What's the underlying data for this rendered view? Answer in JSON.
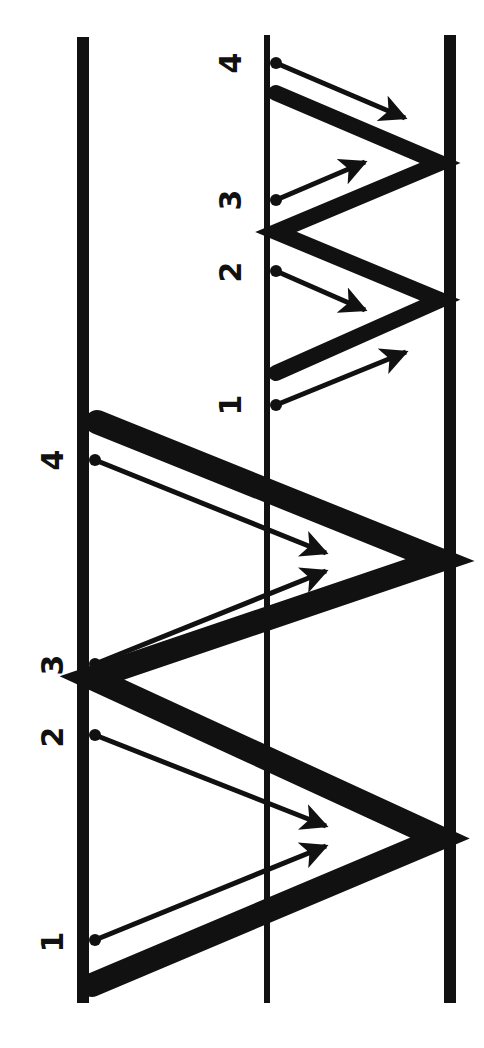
{
  "diagram": {
    "colors": {
      "ink": "#111111",
      "background": "#ffffff"
    },
    "boundaries": [
      {
        "name": "left-boundary",
        "x": 83,
        "y1": 37,
        "y2": 1003,
        "width": 12
      },
      {
        "name": "middle-boundary",
        "x": 267,
        "y1": 35,
        "y2": 1003,
        "width": 6
      },
      {
        "name": "right-boundary",
        "x": 450,
        "y1": 35,
        "y2": 1003,
        "width": 12
      }
    ],
    "large_zigzag": {
      "points": "92,985 440,838 92,678 440,560 97,422",
      "stroke_width": 24,
      "labels": [
        {
          "text": "1",
          "x": 52,
          "y": 942
        },
        {
          "text": "2",
          "x": 52,
          "y": 737
        },
        {
          "text": "3",
          "x": 52,
          "y": 665
        },
        {
          "text": "4",
          "x": 52,
          "y": 460
        }
      ],
      "arrows": [
        {
          "id": "1",
          "x1": 95,
          "y1": 940,
          "x2": 326,
          "y2": 846
        },
        {
          "id": "2",
          "x1": 95,
          "y1": 735,
          "x2": 326,
          "y2": 826
        },
        {
          "id": "3",
          "x1": 95,
          "y1": 664,
          "x2": 326,
          "y2": 571
        },
        {
          "id": "4",
          "x1": 95,
          "y1": 460,
          "x2": 326,
          "y2": 553
        }
      ]
    },
    "small_zigzag": {
      "points": "276,373 440,300 276,232 440,163 276,93",
      "stroke_width": 16,
      "labels": [
        {
          "text": "1",
          "x": 230,
          "y": 405
        },
        {
          "text": "2",
          "x": 230,
          "y": 272
        },
        {
          "text": "3",
          "x": 230,
          "y": 200
        },
        {
          "text": "4",
          "x": 230,
          "y": 63
        }
      ],
      "arrows": [
        {
          "id": "1",
          "x1": 276,
          "y1": 405,
          "x2": 406,
          "y2": 352
        },
        {
          "id": "2",
          "x1": 276,
          "y1": 271,
          "x2": 365,
          "y2": 310
        },
        {
          "id": "3",
          "x1": 276,
          "y1": 200,
          "x2": 365,
          "y2": 162
        },
        {
          "id": "4",
          "x1": 276,
          "y1": 63,
          "x2": 405,
          "y2": 118
        }
      ]
    }
  }
}
